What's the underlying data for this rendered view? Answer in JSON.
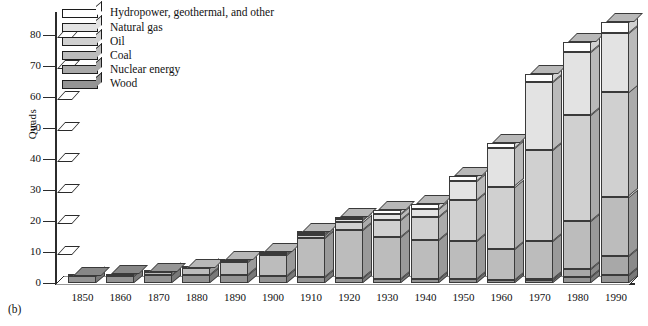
{
  "caption": "(b)",
  "axes": {
    "ylabel": "Quads",
    "yticks": [
      0,
      10,
      20,
      30,
      40,
      50,
      60,
      70,
      80
    ],
    "ymin": 0,
    "ymax": 80
  },
  "legend": {
    "items": [
      {
        "label": "Hydropower, geothermal, and other",
        "color": "#ffffff"
      },
      {
        "label": "Natural gas",
        "color": "#e3e3e3"
      },
      {
        "label": "Oil",
        "color": "#d0d0d0"
      },
      {
        "label": "Coal",
        "color": "#bcbcbc"
      },
      {
        "label": "Nuclear energy",
        "color": "#a8a8a8"
      },
      {
        "label": "Wood",
        "color": "#949494"
      }
    ]
  },
  "chart_data": {
    "type": "bar",
    "title": "",
    "xlabel": "",
    "ylabel": "Quads",
    "ylim": [
      0,
      80
    ],
    "grid": false,
    "stacked": true,
    "legend_position": "top-left",
    "categories": [
      "1850",
      "1860",
      "1870",
      "1880",
      "1890",
      "1900",
      "1910",
      "1920",
      "1930",
      "1940",
      "1950",
      "1960",
      "1970",
      "1980",
      "1990"
    ],
    "series": [
      {
        "name": "Wood",
        "color": "#949494",
        "values": [
          2.2,
          2.4,
          2.6,
          2.6,
          2.5,
          2.2,
          1.9,
          1.6,
          1.4,
          1.3,
          1.2,
          1.0,
          1.0,
          1.8,
          2.6
        ]
      },
      {
        "name": "Nuclear energy",
        "color": "#a8a8a8",
        "values": [
          0,
          0,
          0,
          0,
          0,
          0,
          0,
          0,
          0,
          0,
          0,
          0,
          0.2,
          2.7,
          6.2
        ]
      },
      {
        "name": "Coal",
        "color": "#bcbcbc",
        "values": [
          0.2,
          0.5,
          1.0,
          2.1,
          4.2,
          6.8,
          12.7,
          15.5,
          13.6,
          12.5,
          12.3,
          10.1,
          12.3,
          15.4,
          19.1
        ]
      },
      {
        "name": "Oil",
        "color": "#d0d0d0",
        "values": [
          0,
          0,
          0.1,
          0.2,
          0.2,
          0.3,
          1.0,
          2.6,
          5.4,
          7.5,
          13.3,
          19.9,
          29.5,
          34.2,
          33.6
        ]
      },
      {
        "name": "Natural gas",
        "color": "#e3e3e3",
        "values": [
          0,
          0,
          0,
          0,
          0.1,
          0.3,
          0.5,
          0.8,
          1.9,
          2.7,
          6.0,
          12.4,
          21.8,
          20.4,
          19.3
        ]
      },
      {
        "name": "Hydropower, geothermal, and other",
        "color": "#ffffff",
        "values": [
          0,
          0,
          0,
          0.1,
          0.3,
          0.4,
          0.5,
          0.8,
          1.4,
          1.5,
          1.6,
          1.7,
          2.7,
          3.1,
          3.4
        ]
      }
    ],
    "totals": [
      2.4,
      2.9,
      3.7,
      5.0,
      7.3,
      10.0,
      16.6,
      21.3,
      23.7,
      25.5,
      34.4,
      45.1,
      67.5,
      77.6,
      84.2
    ]
  }
}
